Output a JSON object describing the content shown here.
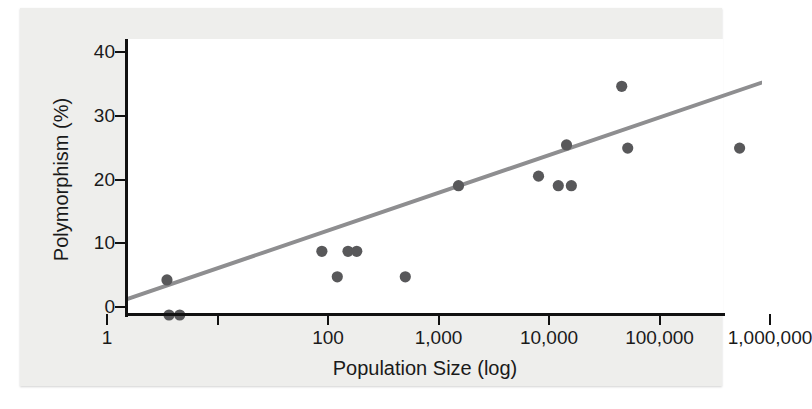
{
  "figure": {
    "background_color": "#eeeeec",
    "plot_background_color": "#ffffff",
    "axis_color": "#111111",
    "marker_color": "#58585a",
    "trendline_color": "#8e8e90"
  },
  "chart_data": {
    "type": "scatter",
    "title": "",
    "subtitle": "",
    "xlabel": "Population Size (log)",
    "ylabel": "Polymorphism (%)",
    "xscale": "log",
    "yscale": "linear",
    "xlim": [
      1,
      1000000
    ],
    "ylim": [
      0,
      43
    ],
    "grid": false,
    "legend": null,
    "x_tick_labels": [
      "1",
      "100",
      "1,000",
      "10,000",
      "100,000",
      "1,000,000"
    ],
    "x_tick_values": [
      1,
      100,
      1000,
      10000,
      100000,
      1000000
    ],
    "x_tick_unlabeled_values": [
      10
    ],
    "y_tick_labels": [
      "0",
      "10",
      "20",
      "30",
      "40"
    ],
    "y_tick_values": [
      0,
      10,
      20,
      30,
      40
    ],
    "points": [
      {
        "x": 2.3,
        "y": 5.5,
        "label": "p1"
      },
      {
        "x": 2.4,
        "y": 0.0,
        "label": "p2"
      },
      {
        "x": 3.0,
        "y": 0.0,
        "label": "p3"
      },
      {
        "x": 58,
        "y": 10.0,
        "label": "p4"
      },
      {
        "x": 80,
        "y": 6.0,
        "label": "p5"
      },
      {
        "x": 100,
        "y": 10.0,
        "label": "p6"
      },
      {
        "x": 120,
        "y": 10.0,
        "label": "p7"
      },
      {
        "x": 330,
        "y": 6.0,
        "label": "p8"
      },
      {
        "x": 1000,
        "y": 20.3,
        "label": "p9"
      },
      {
        "x": 5300,
        "y": 21.8,
        "label": "p10"
      },
      {
        "x": 8000,
        "y": 20.3,
        "label": "p11"
      },
      {
        "x": 9500,
        "y": 26.7,
        "label": "p12"
      },
      {
        "x": 10500,
        "y": 20.3,
        "label": "p13"
      },
      {
        "x": 30000,
        "y": 35.9,
        "label": "p14"
      },
      {
        "x": 34000,
        "y": 26.2,
        "label": "p15"
      },
      {
        "x": 350000,
        "y": 26.2,
        "label": "p16"
      }
    ],
    "trendline": {
      "type": "linear-in-log-x",
      "start": {
        "x": 1,
        "y": 2.5
      },
      "end": {
        "x": 1000000,
        "y": 38.0
      },
      "color": "#8e8e90",
      "width_px": 4
    }
  }
}
